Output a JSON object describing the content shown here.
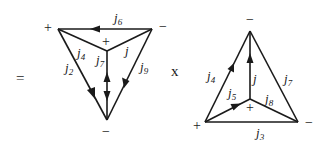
{
  "operators": {
    "equals": "=",
    "times": "x"
  },
  "left_diagram": {
    "vertices": {
      "top_left": {
        "x": 58,
        "y": 29,
        "sign": "+"
      },
      "top_right": {
        "x": 152,
        "y": 29,
        "sign": "−"
      },
      "center": {
        "x": 107,
        "y": 51,
        "sign": "+"
      },
      "bottom": {
        "x": 107,
        "y": 120,
        "sign": "−"
      }
    },
    "edges": [
      {
        "label": "j",
        "sub": "6",
        "from": "top_right",
        "to": "top_left",
        "arrow": "toward top_left"
      },
      {
        "label": "j",
        "sub": "4",
        "from": "top_left",
        "to": "center",
        "arrow": "none"
      },
      {
        "label": "j",
        "sub": "",
        "from": "top_right",
        "to": "center",
        "arrow": "none"
      },
      {
        "label": "j",
        "sub": "2",
        "from": "top_left",
        "to": "bottom",
        "arrow": "toward bottom"
      },
      {
        "label": "j",
        "sub": "7",
        "from": "center",
        "to": "bottom",
        "arrow": "double (up and down)"
      },
      {
        "label": "j",
        "sub": "9",
        "from": "top_right",
        "to": "bottom",
        "arrow": "toward bottom"
      }
    ]
  },
  "right_diagram": {
    "vertices": {
      "top": {
        "x": 250,
        "y": 31,
        "sign": "−"
      },
      "bottom_left": {
        "x": 205,
        "y": 122,
        "sign": "+"
      },
      "bottom_right": {
        "x": 298,
        "y": 122,
        "sign": "−"
      },
      "center": {
        "x": 250,
        "y": 99,
        "sign": "+"
      }
    },
    "edges": [
      {
        "label": "j",
        "sub": "4",
        "from": "bottom_left",
        "to": "top",
        "arrow": "toward top"
      },
      {
        "label": "j",
        "sub": "",
        "from": "center",
        "to": "top",
        "arrow": "toward top"
      },
      {
        "label": "j",
        "sub": "7",
        "from": "bottom_right",
        "to": "top",
        "arrow": "none"
      },
      {
        "label": "j",
        "sub": "5",
        "from": "bottom_left",
        "to": "center",
        "arrow": "toward center"
      },
      {
        "label": "j",
        "sub": "8",
        "from": "center",
        "to": "bottom_right",
        "arrow": "none"
      },
      {
        "label": "j",
        "sub": "3",
        "from": "bottom_left",
        "to": "bottom_right",
        "arrow": "none"
      }
    ]
  },
  "labels": {
    "j": "j",
    "s6": "6",
    "s4": "4",
    "s2": "2",
    "s7": "7",
    "s9": "9",
    "s5": "5",
    "s8": "8",
    "s3": "3",
    "plus": "+",
    "minus": "−"
  }
}
